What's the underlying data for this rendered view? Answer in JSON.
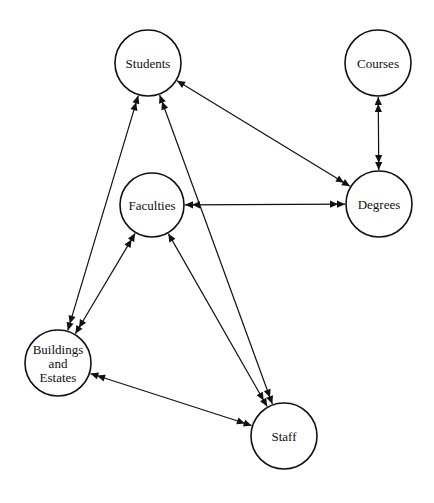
{
  "diagram": {
    "type": "entity-relationship",
    "nodes": [
      {
        "id": "students",
        "label": [
          "Students"
        ],
        "x": 148,
        "y": 63,
        "r": 33
      },
      {
        "id": "courses",
        "label": [
          "Courses"
        ],
        "x": 378,
        "y": 63,
        "r": 33
      },
      {
        "id": "faculties",
        "label": [
          "Faculties"
        ],
        "x": 152,
        "y": 205,
        "r": 32
      },
      {
        "id": "degrees",
        "label": [
          "Degrees"
        ],
        "x": 379,
        "y": 204,
        "r": 33
      },
      {
        "id": "buildings",
        "label": [
          "Buildings",
          "and",
          "Estates"
        ],
        "x": 58,
        "y": 363,
        "r": 33
      },
      {
        "id": "staff",
        "label": [
          "Staff"
        ],
        "x": 284,
        "y": 436,
        "r": 33
      }
    ],
    "edges": [
      {
        "from": "students",
        "to": "buildings",
        "from_card": "many",
        "to_card": "many"
      },
      {
        "from": "students",
        "to": "staff",
        "from_card": "many",
        "to_card": "many"
      },
      {
        "from": "students",
        "to": "degrees",
        "from_card": "one",
        "to_card": "many"
      },
      {
        "from": "courses",
        "to": "degrees",
        "from_card": "many",
        "to_card": "many"
      },
      {
        "from": "faculties",
        "to": "degrees",
        "from_card": "many",
        "to_card": "many"
      },
      {
        "from": "faculties",
        "to": "buildings",
        "from_card": "many",
        "to_card": "many"
      },
      {
        "from": "faculties",
        "to": "staff",
        "from_card": "one",
        "to_card": "many"
      },
      {
        "from": "buildings",
        "to": "staff",
        "from_card": "many",
        "to_card": "many"
      }
    ]
  },
  "colors": {
    "stroke": "#111111",
    "background": "#ffffff"
  }
}
